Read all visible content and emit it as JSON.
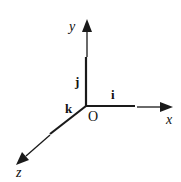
{
  "diagram": {
    "type": "3d-coordinate-axes",
    "origin_label": "O",
    "axes": [
      {
        "name": "x",
        "axis_label": "x",
        "unit_vector_label": "i"
      },
      {
        "name": "y",
        "axis_label": "y",
        "unit_vector_label": "j"
      },
      {
        "name": "z",
        "axis_label": "z",
        "unit_vector_label": "k"
      }
    ],
    "colors": {
      "line": "#1a1a1a",
      "background": "#ffffff"
    }
  }
}
